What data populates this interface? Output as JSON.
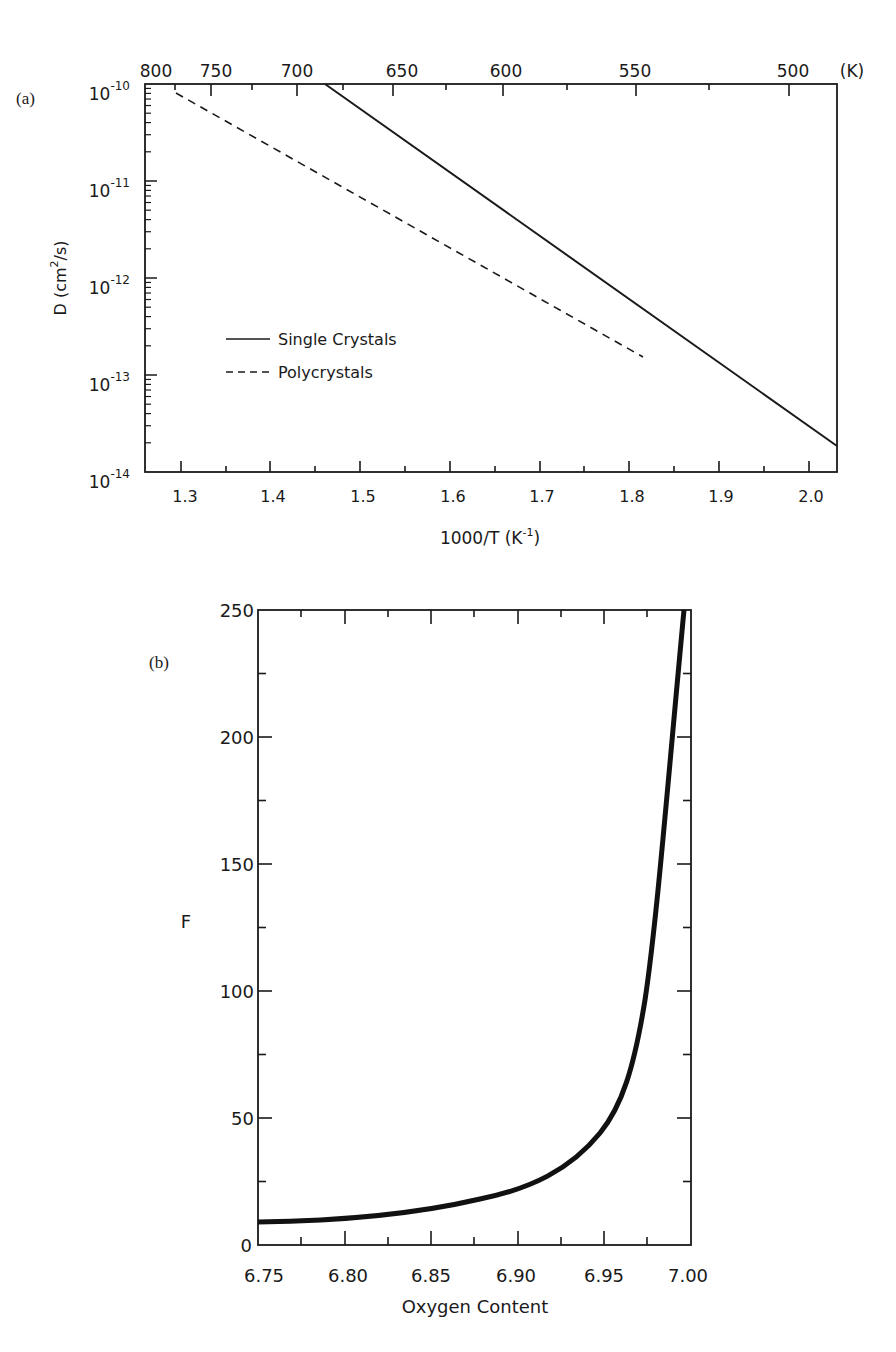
{
  "chart_data": [
    {
      "panel": "(a)",
      "type": "line",
      "title": "",
      "xlabel": "1000/T (K^-1)",
      "ylabel": "D (cm^2/s)",
      "yscale": "log",
      "xlim": [
        1.26,
        2.05
      ],
      "ylim": [
        1e-14,
        1e-10
      ],
      "x_ticks": [
        "1.3",
        "1.4",
        "1.5",
        "1.6",
        "1.7",
        "1.8",
        "1.9",
        "2.0"
      ],
      "y_ticks": [
        "10^-10",
        "10^-11",
        "10^-12",
        "10^-13",
        "10^-14"
      ],
      "top_axis": {
        "label": "(K)",
        "ticks": [
          "800",
          "750",
          "700",
          "650",
          "600",
          "550",
          "500"
        ]
      },
      "grid": false,
      "legend_position": "lower-left",
      "series": [
        {
          "name": "Single Crystals",
          "style": "solid",
          "x": [
            1.46,
            2.05
          ],
          "y": [
            1e-10,
            2.2e-14
          ]
        },
        {
          "name": "Polycrystals",
          "style": "dashed",
          "x": [
            1.29,
            1.82
          ],
          "y": [
            8e-11,
            1.6e-13
          ]
        }
      ]
    },
    {
      "panel": "(b)",
      "type": "line",
      "title": "",
      "xlabel": "Oxygen Content",
      "ylabel": "F",
      "xlim": [
        6.75,
        7.0
      ],
      "ylim": [
        0,
        250
      ],
      "x_ticks": [
        "6.75",
        "6.80",
        "6.85",
        "6.90",
        "6.95",
        "7.00"
      ],
      "y_ticks": [
        "0",
        "50",
        "100",
        "150",
        "200",
        "250"
      ],
      "grid": false,
      "series": [
        {
          "name": "F",
          "style": "solid-thick",
          "x": [
            6.75,
            6.78,
            6.8,
            6.83,
            6.85,
            6.87,
            6.9,
            6.92,
            6.94,
            6.95,
            6.96,
            6.97,
            6.975,
            6.98,
            6.985,
            6.988,
            6.99,
            6.992
          ],
          "y": [
            9,
            9.5,
            10.5,
            12,
            13.5,
            15.5,
            19.5,
            24,
            32,
            38,
            48,
            62,
            72,
            85,
            110,
            140,
            190,
            250
          ]
        }
      ]
    }
  ],
  "panel_a": {
    "panel_label": "(a)",
    "top_ticks": [
      "800",
      "750",
      "700",
      "650",
      "600",
      "550",
      "500"
    ],
    "top_unit": "(K)",
    "bottom_ticks": [
      "1.3",
      "1.4",
      "1.5",
      "1.6",
      "1.7",
      "1.8",
      "1.9",
      "2.0"
    ],
    "y_exponents": [
      "-10",
      "-11",
      "-12",
      "-13",
      "-14"
    ],
    "y_base": "10",
    "xlabel_main": "1000/T (K",
    "xlabel_sup": "-1",
    "xlabel_end": ")",
    "ylabel_main": "D (cm",
    "ylabel_sup": "2",
    "ylabel_end": "/s)",
    "legend": {
      "solid": "Single Crystals",
      "dashed": "Polycrystals"
    }
  },
  "panel_b": {
    "panel_label": "(b)",
    "x_ticks": [
      "6.75",
      "6.80",
      "6.85",
      "6.90",
      "6.95",
      "7.00"
    ],
    "y_ticks": [
      "0",
      "50",
      "100",
      "150",
      "200",
      "250"
    ],
    "xlabel": "Oxygen Content",
    "ylabel": "F"
  }
}
